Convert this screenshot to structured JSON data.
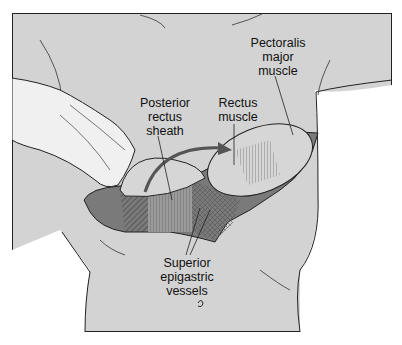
{
  "figure": {
    "labels": {
      "pectoralis": [
        "Pectoralis",
        "major",
        "muscle"
      ],
      "posterior_sheath": [
        "Posterior",
        "rectus",
        "sheath"
      ],
      "rectus_muscle": [
        "Rectus",
        "muscle"
      ],
      "epigastric": [
        "Superior",
        "epigastric",
        "vessels"
      ]
    },
    "colors": {
      "background": "#d3d3d3",
      "muscle_dark": "#7a7a7a",
      "line": "#222222"
    }
  }
}
